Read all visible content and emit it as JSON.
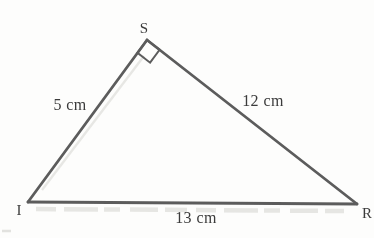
{
  "figure": {
    "type": "geometry-diagram",
    "colors": {
      "stroke": "#5c5c5c",
      "label": "#3a3a3a",
      "background": "#fdfdfc"
    },
    "vertices": {
      "S": {
        "label": "S",
        "x": 147,
        "y": 40,
        "label_x": 144,
        "label_y": 33
      },
      "I": {
        "label": "I",
        "x": 28,
        "y": 202,
        "label_x": 19,
        "label_y": 215
      },
      "R": {
        "label": "R",
        "x": 357,
        "y": 204,
        "label_x": 367,
        "label_y": 218
      }
    },
    "sides": [
      {
        "from": "I",
        "to": "S",
        "label": "5 cm",
        "label_x": 70,
        "label_y": 110
      },
      {
        "from": "S",
        "to": "R",
        "label": "12 cm",
        "label_x": 263,
        "label_y": 106
      },
      {
        "from": "I",
        "to": "R",
        "label": "13 cm",
        "label_x": 196,
        "label_y": 223
      }
    ],
    "right_angle_marker": {
      "vertex": "S",
      "toward": [
        "I",
        "R"
      ],
      "size": 16
    }
  }
}
